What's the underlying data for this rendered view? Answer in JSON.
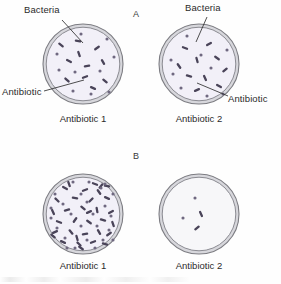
{
  "figure": {
    "background_color": "#fefefe",
    "panels": [
      {
        "id": "A",
        "label": "A",
        "label_x": 133,
        "label_y": 13,
        "dishes": [
          {
            "id": "a1",
            "caption": "Antibiotic 1",
            "caption_x": 83,
            "caption_y": 118,
            "cx": 83,
            "cy": 64,
            "r": 40,
            "callouts": [
              {
                "name": "bacteria",
                "label": "Bacteria",
                "label_x": 24,
                "label_y": 7,
                "line": [
                  62,
                  20,
                  83,
                  43
                ]
              },
              {
                "name": "antibiotic",
                "label": "Antibiotic",
                "label_x": 2,
                "label_y": 89,
                "line": [
                  44,
                  91,
                  84,
                  80
                ]
              }
            ]
          },
          {
            "id": "a2",
            "caption": "Antibiotic 2",
            "caption_x": 199,
            "caption_y": 118,
            "cx": 199,
            "cy": 64,
            "r": 40,
            "callouts": [
              {
                "name": "bacteria",
                "label": "Bacteria",
                "label_x": 186,
                "label_y": 5,
                "line": [
                  207,
                  17,
                  196,
                  42
                ]
              },
              {
                "name": "antibiotic",
                "label": "Antibiotic",
                "label_x": 229,
                "label_y": 96,
                "line": [
                  228,
                  96,
                  197,
                  83
                ]
              }
            ]
          }
        ]
      },
      {
        "id": "B",
        "label": "B",
        "label_x": 133,
        "label_y": 155,
        "dishes": [
          {
            "id": "b1",
            "caption": "Antibiotic 1",
            "caption_x": 83,
            "caption_y": 264,
            "cx": 83,
            "cy": 214,
            "r": 40,
            "callouts": []
          },
          {
            "id": "b2",
            "caption": "Antibiotic 2",
            "caption_x": 199,
            "caption_y": 264,
            "cx": 199,
            "cy": 214,
            "r": 40,
            "callouts": []
          }
        ]
      }
    ],
    "colors": {
      "rim_outer": "#7c7c82",
      "rim_inner": "#8b8b92",
      "rim_band": "#d7d7dc",
      "agar_fill_tinted": "#f2f0f8",
      "agar_fill_plain": "#f7f7f9",
      "bacteria_rod": "#4a4459",
      "bacteria_dot": "#6f6880",
      "callout_line": "#2f2f2f",
      "text": "#2b2b2b"
    }
  },
  "chart_data": {
    "type": "diagram",
    "dish_contents": {
      "a1": {
        "caption": "Antibiotic 1",
        "rod_count": 11,
        "dot_count": 10,
        "density": "moderate",
        "rods": [
          [
            -22,
            -19,
            38
          ],
          [
            -5,
            -23,
            12
          ],
          [
            14,
            -16,
            -35
          ],
          [
            -14,
            -3,
            28
          ],
          [
            4,
            2,
            -8
          ],
          [
            20,
            -2,
            60
          ],
          [
            -16,
            16,
            42
          ],
          [
            2,
            13,
            -20
          ],
          [
            22,
            17,
            40
          ],
          [
            10,
            24,
            25
          ],
          [
            -4,
            -10,
            70
          ]
        ],
        "dots": [
          [
            -26,
            -10
          ],
          [
            -2,
            -30
          ],
          [
            24,
            -25
          ],
          [
            31,
            -7
          ],
          [
            -24,
            6
          ],
          [
            -8,
            8
          ],
          [
            17,
            7
          ],
          [
            -10,
            27
          ],
          [
            8,
            30
          ],
          [
            26,
            28
          ]
        ]
      },
      "a2": {
        "caption": "Antibiotic 2",
        "rod_count": 10,
        "dot_count": 9,
        "density": "moderate",
        "rods": [
          [
            -14,
            -16,
            20
          ],
          [
            10,
            -20,
            -30
          ],
          [
            -20,
            2,
            55
          ],
          [
            -2,
            -4,
            75
          ],
          [
            18,
            -6,
            35
          ],
          [
            26,
            6,
            -40
          ],
          [
            -10,
            12,
            15
          ],
          [
            6,
            14,
            65
          ],
          [
            -2,
            26,
            -25
          ],
          [
            20,
            22,
            30
          ]
        ],
        "dots": [
          [
            -12,
            -28
          ],
          [
            -28,
            -4
          ],
          [
            -26,
            10
          ],
          [
            2,
            -9
          ],
          [
            12,
            4
          ],
          [
            -18,
            24
          ],
          [
            28,
            -14
          ],
          [
            24,
            30
          ],
          [
            8,
            32
          ]
        ]
      },
      "b1": {
        "caption": "Antibiotic 1",
        "rod_count": 34,
        "dot_count": 26,
        "density": "heavy",
        "rods": [
          [
            -18,
            -26,
            30
          ],
          [
            2,
            -24,
            -20
          ],
          [
            16,
            -22,
            55
          ],
          [
            -26,
            -14,
            45
          ],
          [
            -8,
            -16,
            10
          ],
          [
            8,
            -14,
            -45
          ],
          [
            24,
            -16,
            25
          ],
          [
            -30,
            -2,
            65
          ],
          [
            -16,
            -4,
            -15
          ],
          [
            0,
            -6,
            40
          ],
          [
            14,
            -4,
            80
          ],
          [
            28,
            -2,
            -30
          ],
          [
            -24,
            8,
            20
          ],
          [
            -8,
            6,
            -55
          ],
          [
            6,
            8,
            35
          ],
          [
            20,
            6,
            15
          ],
          [
            30,
            10,
            70
          ],
          [
            -28,
            18,
            -25
          ],
          [
            -12,
            18,
            50
          ],
          [
            2,
            20,
            -10
          ],
          [
            16,
            18,
            60
          ],
          [
            26,
            20,
            -35
          ],
          [
            -20,
            28,
            25
          ],
          [
            -4,
            30,
            45
          ],
          [
            10,
            28,
            -20
          ],
          [
            22,
            30,
            15
          ],
          [
            -14,
            -30,
            70
          ],
          [
            12,
            -30,
            20
          ],
          [
            -2,
            34,
            35
          ],
          [
            18,
            -28,
            -50
          ],
          [
            -30,
            22,
            40
          ],
          [
            6,
            -2,
            -25
          ],
          [
            -6,
            24,
            75
          ],
          [
            24,
            -28,
            10
          ]
        ],
        "dots": [
          [
            -10,
            -32
          ],
          [
            6,
            -32
          ],
          [
            22,
            -30
          ],
          [
            -28,
            -20
          ],
          [
            -2,
            -20
          ],
          [
            18,
            -26
          ],
          [
            30,
            -20
          ],
          [
            -20,
            -10
          ],
          [
            4,
            -12
          ],
          [
            22,
            -8
          ],
          [
            -32,
            4
          ],
          [
            -12,
            0
          ],
          [
            10,
            0
          ],
          [
            26,
            16
          ],
          [
            -26,
            14
          ],
          [
            -2,
            12
          ],
          [
            14,
            12
          ],
          [
            -18,
            24
          ],
          [
            4,
            26
          ],
          [
            20,
            26
          ],
          [
            -8,
            34
          ],
          [
            12,
            34
          ],
          [
            28,
            2
          ],
          [
            -32,
            -6
          ],
          [
            30,
            26
          ],
          [
            -16,
            34
          ]
        ]
      },
      "b2": {
        "caption": "Antibiotic 2",
        "rod_count": 2,
        "dot_count": 2,
        "density": "sparse",
        "rods": [
          [
            2,
            0,
            65
          ],
          [
            -2,
            14,
            -40
          ]
        ],
        "dots": [
          [
            -4,
            -16
          ],
          [
            -16,
            4
          ]
        ]
      }
    }
  }
}
